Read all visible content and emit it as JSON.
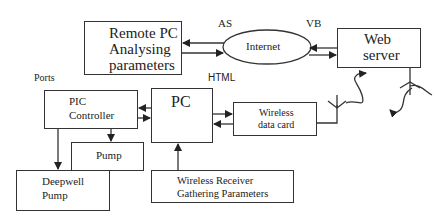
{
  "diagram": {
    "nodes": {
      "remote_pc": {
        "line1": "Remote PC",
        "line2": "Analysing",
        "line3": "parameters"
      },
      "internet": {
        "label": "Internet"
      },
      "web_server": {
        "line1": "Web",
        "line2": "server"
      },
      "pic_controller": {
        "line1": "PIC",
        "line2": "Controller"
      },
      "pc": {
        "label": "PC"
      },
      "wireless_data_card": {
        "line1": "Wireless",
        "line2": "data card"
      },
      "pump": {
        "label": "Pump"
      },
      "deepwell_pump": {
        "line1": "Deepwell",
        "line2": "Pump"
      },
      "wireless_receiver": {
        "line1": "Wireless Receiver",
        "line2": "Gathering Parameters"
      }
    },
    "annotations": {
      "as": "AS",
      "vb": "VB",
      "html": "HTML",
      "ports": "Ports"
    },
    "edges": [
      {
        "from": "internet",
        "to": "remote_pc"
      },
      {
        "from": "remote_pc",
        "to": "internet"
      },
      {
        "from": "web_server",
        "to": "internet"
      },
      {
        "from": "internet",
        "to": "web_server"
      },
      {
        "from": "pc",
        "to": "pic_controller"
      },
      {
        "from": "pic_controller",
        "to": "pc"
      },
      {
        "from": "pc",
        "to": "wireless_data_card"
      },
      {
        "from": "wireless_data_card",
        "to": "pc"
      },
      {
        "from": "pic_controller",
        "to": "pump"
      },
      {
        "from": "pic_controller",
        "to": "deepwell_pump"
      },
      {
        "from": "wireless_receiver",
        "to": "pc"
      },
      {
        "from": "wireless_data_card",
        "to": "web_server",
        "type": "wireless"
      }
    ]
  }
}
